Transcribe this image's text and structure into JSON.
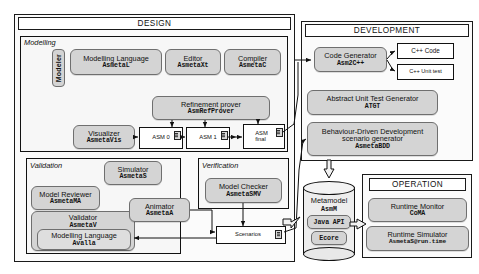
{
  "diagram": {
    "panels": {
      "design": "DESIGN",
      "development": "DEVELOPMENT",
      "operation": "OPERATION"
    },
    "groups": {
      "modelling": "Modelling",
      "validation": "Validation",
      "verification": "Verification"
    },
    "roles": {
      "modeler": "Modeler"
    },
    "design": {
      "modelling_language": {
        "name": "Modelling Language",
        "tool": "AsmetaL"
      },
      "editor": {
        "name": "Editor",
        "tool": "AsmetaXt"
      },
      "compiler": {
        "name": "Compiler",
        "tool": "AsmetaC"
      },
      "refinement_prover": {
        "name": "Refinement prover",
        "tool": "AsmRefProver"
      },
      "visualizer": {
        "name": "Visualizer",
        "tool": "AsmetaVis"
      },
      "asm0": "ASM 0",
      "asm1": "ASM 1",
      "asmfinal_line1": "ASM",
      "asmfinal_line2": "final"
    },
    "validation": {
      "simulator": {
        "name": "Simulator",
        "tool": "AsmetaS"
      },
      "model_reviewer": {
        "name": "Model Reviewer",
        "tool": "AsmetaMA"
      },
      "validator": {
        "name": "Validator",
        "tool": "AsmetaV"
      },
      "avalla": {
        "name": "Modelling Language",
        "tool": "Avalla"
      },
      "animator": {
        "name": "Animator",
        "tool": "AsmetaA"
      }
    },
    "verification": {
      "model_checker": {
        "name": "Model Checker",
        "tool": "AsmetaSMV"
      }
    },
    "artifacts": {
      "scenarios": "Scenarios"
    },
    "development": {
      "code_generator": {
        "name": "Code Generator",
        "tool": "Asm2C++"
      },
      "cpp_code": "C++ Code",
      "cpp_unit_test": "C++ Unit test",
      "atgt": {
        "name": "Abstract Unit Test Generator",
        "tool": "ATGT"
      },
      "bdd": {
        "name_line1": "Behaviour-Driven Development",
        "name_line2": "scenario generator",
        "tool": "AsmetaBDD"
      }
    },
    "metamodel": {
      "name": "Metamodel",
      "tool": "AsmM",
      "java_api": "Java API",
      "ecore": "Ecore"
    },
    "operation": {
      "runtime_monitor": {
        "name": "Runtime Monitor",
        "tool": "CoMA"
      },
      "runtime_simulator": {
        "name": "Runtime Simulator",
        "tool": "AsmetaS@run.time"
      }
    },
    "colors": {
      "tool_fill": "#d4d4d4",
      "panel_border": "#1a1a1a",
      "artifact_fill": "#ffffff",
      "group_fill": "#f7f7f7"
    }
  }
}
